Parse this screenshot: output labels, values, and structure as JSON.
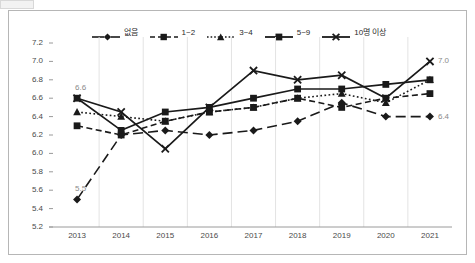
{
  "chart_data": {
    "type": "line",
    "title": "",
    "xlabel": "",
    "ylabel": "",
    "categories": [
      "2013",
      "2014",
      "2015",
      "2016",
      "2017",
      "2018",
      "2019",
      "2020",
      "2021"
    ],
    "ylim": [
      5.2,
      7.2
    ],
    "y_ticks": [
      "7.2",
      "7.0",
      "6.8",
      "6.6",
      "6.4",
      "6.2",
      "6.0",
      "5.8",
      "5.6",
      "5.4",
      "5.2"
    ],
    "y_tick_values": [
      7.2,
      7.0,
      6.8,
      6.6,
      6.4,
      6.2,
      6.0,
      5.8,
      5.6,
      5.4,
      5.2
    ],
    "grid": "vertical",
    "legend_position": "top-center",
    "series": [
      {
        "name": "없음",
        "marker": "diamond",
        "dash": "long-dash",
        "values": [
          5.5,
          6.2,
          6.25,
          6.2,
          6.25,
          6.35,
          6.55,
          6.4,
          6.4
        ]
      },
      {
        "name": "1~2",
        "marker": "square",
        "dash": "dash",
        "values": [
          6.3,
          6.2,
          6.35,
          6.45,
          6.5,
          6.6,
          6.5,
          6.6,
          6.65
        ]
      },
      {
        "name": "3~4",
        "marker": "triangle",
        "dash": "dot",
        "values": [
          6.45,
          6.4,
          6.35,
          6.45,
          6.5,
          6.6,
          6.65,
          6.55,
          6.8
        ]
      },
      {
        "name": "5~9",
        "marker": "square",
        "dash": "solid",
        "values": [
          6.6,
          6.25,
          6.45,
          6.5,
          6.6,
          6.7,
          6.7,
          6.75,
          6.8
        ]
      },
      {
        "name": "10명 이상",
        "marker": "cross",
        "dash": "solid",
        "values": [
          6.6,
          6.45,
          6.05,
          6.5,
          6.9,
          6.8,
          6.85,
          6.6,
          7.0
        ]
      }
    ],
    "point_labels": [
      {
        "text": "6.6",
        "series": "5~9",
        "category": "2013",
        "value": 6.6
      },
      {
        "text": "5.5",
        "series": "없음",
        "category": "2013",
        "value": 5.5
      },
      {
        "text": "7.0",
        "series": "10명 이상",
        "category": "2021",
        "value": 7.0
      },
      {
        "text": "6.4",
        "series": "없음",
        "category": "2021",
        "value": 6.4
      }
    ]
  },
  "legend": {
    "items": [
      {
        "label": "없음",
        "icon": "line-diamond-marker-icon"
      },
      {
        "label": "1~2",
        "icon": "line-square-marker-icon"
      },
      {
        "label": "3~4",
        "icon": "line-triangle-marker-icon"
      },
      {
        "label": "5~9",
        "icon": "line-square-marker-icon"
      },
      {
        "label": "10명 이상",
        "icon": "line-cross-marker-icon"
      }
    ]
  },
  "colors": {
    "series": "#1a1a1a",
    "axis_text": "#4a4a4a",
    "label_text": "#8a8a8a",
    "grid": "#e3e3e3",
    "frame": "#b6b6b6"
  }
}
